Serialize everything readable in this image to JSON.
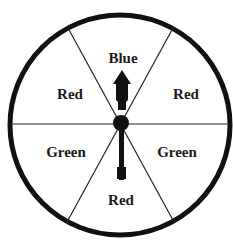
{
  "spinner": {
    "sections": [
      {
        "label": "Blue",
        "position": "top"
      },
      {
        "label": "Red",
        "position": "upper-right"
      },
      {
        "label": "Green",
        "position": "lower-right"
      },
      {
        "label": "Red",
        "position": "bottom"
      },
      {
        "label": "Green",
        "position": "lower-left"
      },
      {
        "label": "Red",
        "position": "upper-left"
      }
    ],
    "arrow_points_to": "Blue",
    "colors": {
      "stroke": "#111111",
      "background": "#ffffff"
    }
  }
}
